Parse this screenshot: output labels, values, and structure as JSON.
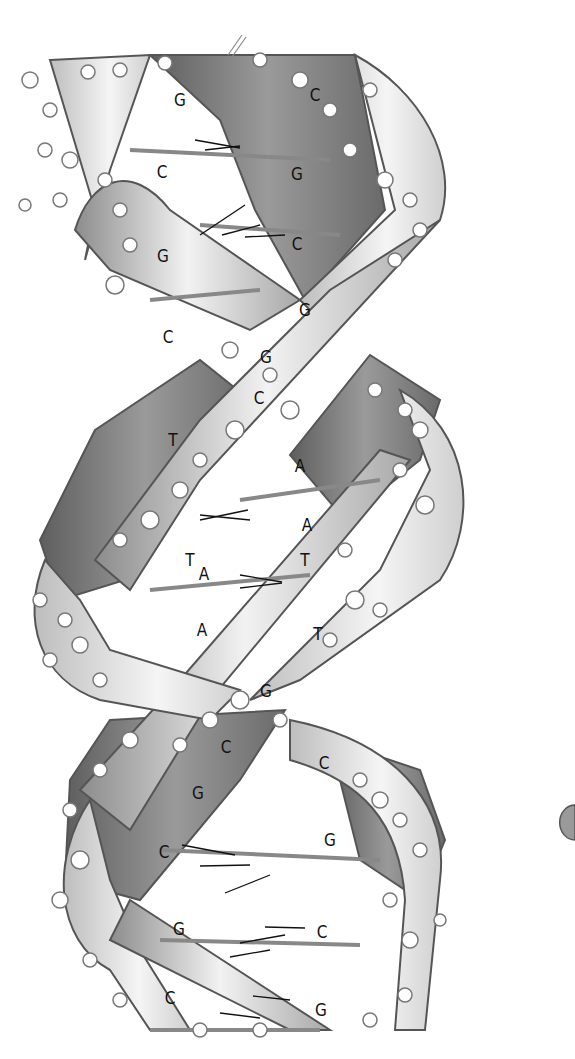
{
  "figure": {
    "style": "grayscale ball-and-stick with ribbon backbones",
    "colors": {
      "background": "#ffffff",
      "ribbon_dark": "#6f6f6f",
      "ribbon_mid": "#9a9a9a",
      "ribbon_light": "#e6e6e6",
      "ribbon_edge": "#555555",
      "atom_fill": "#ffffff",
      "atom_stroke": "#777777",
      "label": "#111111"
    }
  },
  "base_labels": [
    {
      "text": "G",
      "x": 180,
      "y": 100
    },
    {
      "text": "C",
      "x": 315,
      "y": 95
    },
    {
      "text": "C",
      "x": 162,
      "y": 172
    },
    {
      "text": "G",
      "x": 297,
      "y": 174
    },
    {
      "text": "G",
      "x": 163,
      "y": 256
    },
    {
      "text": "C",
      "x": 297,
      "y": 244
    },
    {
      "text": "G",
      "x": 305,
      "y": 310
    },
    {
      "text": "C",
      "x": 168,
      "y": 337
    },
    {
      "text": "G",
      "x": 266,
      "y": 357
    },
    {
      "text": "C",
      "x": 259,
      "y": 398
    },
    {
      "text": "T",
      "x": 173,
      "y": 440
    },
    {
      "text": "A",
      "x": 300,
      "y": 466
    },
    {
      "text": "A",
      "x": 307,
      "y": 525
    },
    {
      "text": "T",
      "x": 190,
      "y": 560
    },
    {
      "text": "A",
      "x": 204,
      "y": 574
    },
    {
      "text": "T",
      "x": 305,
      "y": 560
    },
    {
      "text": "A",
      "x": 202,
      "y": 630
    },
    {
      "text": "T",
      "x": 318,
      "y": 634
    },
    {
      "text": "G",
      "x": 266,
      "y": 691
    },
    {
      "text": "C",
      "x": 226,
      "y": 747
    },
    {
      "text": "C",
      "x": 324,
      "y": 763
    },
    {
      "text": "G",
      "x": 198,
      "y": 793
    },
    {
      "text": "G",
      "x": 330,
      "y": 840
    },
    {
      "text": "C",
      "x": 164,
      "y": 852
    },
    {
      "text": "G",
      "x": 179,
      "y": 929
    },
    {
      "text": "C",
      "x": 322,
      "y": 932
    },
    {
      "text": "C",
      "x": 170,
      "y": 998
    },
    {
      "text": "G",
      "x": 321,
      "y": 1010
    }
  ]
}
